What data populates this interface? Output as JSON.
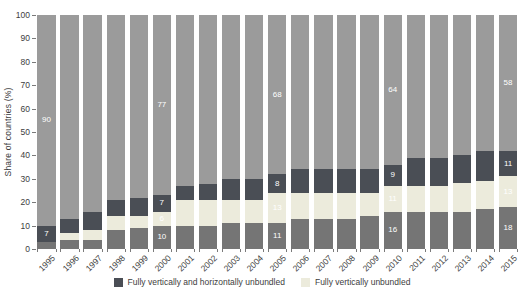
{
  "chart_data": {
    "type": "bar",
    "stacked": true,
    "title": "",
    "ylabel": "Share of countries (%)",
    "xlabel": "",
    "ylim": [
      0,
      100
    ],
    "y_ticks": [
      0,
      10,
      20,
      30,
      40,
      50,
      60,
      70,
      80,
      90,
      100
    ],
    "grid": false,
    "legend_position": "bottom",
    "categories": [
      "1995",
      "1996",
      "1997",
      "1998",
      "1999",
      "2000",
      "2001",
      "2002",
      "2003",
      "2004",
      "2005",
      "2006",
      "2007",
      "2008",
      "2009",
      "2010",
      "2011",
      "2012",
      "2013",
      "2014",
      "2015"
    ],
    "series": [
      {
        "key": "bottom",
        "name": "bottom-dark-gray-segment",
        "legend_label": null,
        "color": "#757575",
        "values": [
          3,
          4,
          4,
          8,
          9,
          10,
          10,
          10,
          11,
          11,
          11,
          13,
          13,
          13,
          14,
          16,
          16,
          16,
          16,
          17,
          18
        ]
      },
      {
        "key": "cream",
        "name": "fully-vertically-unbundled",
        "legend_label": "Fully vertically unbundled",
        "color": "#ecebdc",
        "values": [
          0,
          3,
          4,
          6,
          5,
          6,
          11,
          11,
          10,
          10,
          13,
          11,
          11,
          11,
          10,
          11,
          11,
          11,
          12,
          12,
          13
        ]
      },
      {
        "key": "navy",
        "name": "fully-vertically-and-horizontally-unbundled",
        "legend_label": "Fully vertically and horizontally unbundled",
        "color": "#4a4e55",
        "values": [
          7,
          6,
          8,
          7,
          8,
          7,
          6,
          7,
          9,
          9,
          8,
          10,
          10,
          10,
          10,
          9,
          12,
          12,
          12,
          13,
          11
        ]
      },
      {
        "key": "top",
        "name": "top-light-gray-segment",
        "legend_label": null,
        "color": "#9b9b9b",
        "values": [
          90,
          87,
          84,
          79,
          78,
          77,
          73,
          72,
          70,
          70,
          68,
          66,
          66,
          66,
          66,
          64,
          61,
          61,
          60,
          58,
          58
        ]
      }
    ],
    "value_labels": {
      "1995": {
        "navy": "7",
        "top": "90"
      },
      "2000": {
        "bottom": "10",
        "cream": "6",
        "navy": "7",
        "top": "77"
      },
      "2005": {
        "bottom": "11",
        "cream": "13",
        "navy": "8",
        "top": "68"
      },
      "2010": {
        "bottom": "16",
        "cream": "11",
        "navy": "9",
        "top": "64"
      },
      "2015": {
        "bottom": "18",
        "cream": "13",
        "navy": "11",
        "top": "58"
      }
    },
    "legend": [
      {
        "label": "Fully vertically and horizontally unbundled",
        "color": "#4a4e55"
      },
      {
        "label": "Fully vertically unbundled",
        "color": "#ecebdc"
      }
    ],
    "colors": {
      "axis_text": "#3d3d3d",
      "tick_mark": "#7a7a7a",
      "bar_value_label": "#ffffff",
      "background": "#ffffff"
    }
  }
}
